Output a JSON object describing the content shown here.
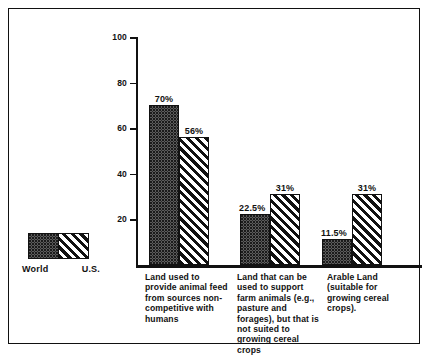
{
  "chart_data": {
    "type": "bar",
    "title": "",
    "subtitle": "",
    "xlabel": "",
    "ylabel": "",
    "ylim": [
      0,
      100
    ],
    "yticks": [
      20,
      40,
      60,
      80,
      100
    ],
    "grid": false,
    "legend_position": "bottom-left",
    "categories": [
      "Land used to provide animal feed from sources non-competitive with humans",
      "Land that can be used to support farm animals (e.g., pasture and forages), but that is not suited to growing cereal crops",
      "Arable Land (suitable for growing cereal crops)."
    ],
    "series": [
      {
        "name": "World",
        "pattern": "dotted",
        "values": [
          70,
          22.5,
          11.5
        ],
        "labels": [
          "70%",
          "22.5%",
          "11.5%"
        ]
      },
      {
        "name": "U.S.",
        "pattern": "diagonal-hatch",
        "values": [
          56,
          31,
          31
        ],
        "labels": [
          "56%",
          "31%",
          "31%"
        ]
      }
    ]
  },
  "legend": {
    "items": [
      {
        "label": "World",
        "pattern": "dotted"
      },
      {
        "label": "U.S.",
        "pattern": "diagonal-hatch"
      }
    ]
  },
  "axis": {
    "y_tick_labels": [
      "100",
      "80",
      "60",
      "40",
      "20"
    ]
  },
  "colors": {
    "ink": "#111111",
    "background": "#ffffff",
    "bar_world_fill": "#8e8e8e",
    "bar_us_fill": "#ffffff"
  }
}
